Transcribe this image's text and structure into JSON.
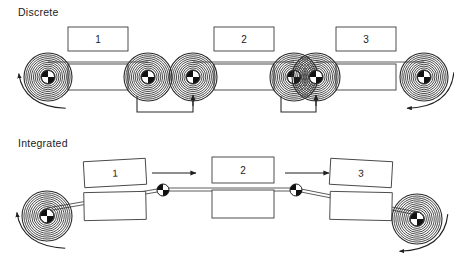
{
  "figure": {
    "kind": "process-diagram",
    "background_color": "#ffffff",
    "line_color": "#2b2b2b"
  },
  "sections": [
    {
      "id": "discrete",
      "label": "Discrete",
      "label_x": 18,
      "label_y": 16,
      "description_visual": "three separate stations, each with its own pair of material spools; brackets with up arrows indicate manual transfer of the spool between stations",
      "web_y": 62,
      "stations": [
        {
          "number": "1",
          "box_cx": 98,
          "top_box": {
            "x": 68,
            "y": 27,
            "w": 60,
            "h": 24
          },
          "bottom_box": {
            "x": 68,
            "y": 64,
            "w": 60,
            "h": 26
          }
        },
        {
          "number": "2",
          "box_cx": 244,
          "top_box": {
            "x": 214,
            "y": 27,
            "w": 60,
            "h": 24
          },
          "bottom_box": {
            "x": 214,
            "y": 64,
            "w": 60,
            "h": 26
          }
        },
        {
          "number": "3",
          "box_cx": 366,
          "top_box": {
            "x": 336,
            "y": 27,
            "w": 60,
            "h": 24
          },
          "bottom_box": {
            "x": 336,
            "y": 64,
            "w": 60,
            "h": 26
          }
        }
      ],
      "spools": [
        {
          "cx": 48,
          "cy": 77,
          "r": 24
        },
        {
          "cx": 148,
          "cy": 77,
          "r": 24
        },
        {
          "cx": 193,
          "cy": 77,
          "r": 24
        },
        {
          "cx": 294,
          "cy": 77,
          "r": 24
        },
        {
          "cx": 316,
          "cy": 77,
          "r": 24
        },
        {
          "cx": 424,
          "cy": 77,
          "r": 24
        }
      ],
      "webs": [
        {
          "x1": 48,
          "x2": 148,
          "y": 62
        },
        {
          "x1": 193,
          "x2": 294,
          "y": 62
        },
        {
          "x1": 316,
          "x2": 424,
          "y": 62
        }
      ],
      "transfer_brackets": [
        {
          "from_x": 137,
          "to_x": 193,
          "y": 112,
          "arrow_on": "right"
        },
        {
          "from_x": 281,
          "to_x": 316,
          "y": 112,
          "arrow_on": "right"
        }
      ],
      "rotation_arrows": [
        {
          "at": "left-spool",
          "cx": 48,
          "cy": 77,
          "direction": "counterclockwise"
        },
        {
          "at": "right-spool",
          "cx": 424,
          "cy": 77,
          "direction": "clockwise"
        }
      ]
    },
    {
      "id": "integrated",
      "label": "Integrated",
      "label_x": 18,
      "label_y": 147,
      "description_visual": "one continuous web runs from a single unwind spool through all three stations to a single rewind spool, supported by small idler rollers; straight arrows show the web travel direction",
      "stations": [
        {
          "number": "1",
          "box_cx": 114,
          "top_box": {
            "x": 84,
            "y": 160,
            "w": 62,
            "h": 26,
            "skew": -3.2
          },
          "bottom_box": {
            "x": 84,
            "y": 192,
            "w": 62,
            "h": 28,
            "skew": -1.2
          }
        },
        {
          "number": "2",
          "box_cx": 243,
          "top_box": {
            "x": 212,
            "y": 157,
            "w": 62,
            "h": 26,
            "skew": 0
          },
          "bottom_box": {
            "x": 212,
            "y": 190,
            "w": 62,
            "h": 28,
            "skew": 0
          }
        },
        {
          "number": "3",
          "box_cx": 361,
          "top_box": {
            "x": 330,
            "y": 160,
            "w": 62,
            "h": 26,
            "skew": 3.2
          },
          "bottom_box": {
            "x": 330,
            "y": 192,
            "w": 62,
            "h": 28,
            "skew": 1.2
          }
        }
      ],
      "spools": [
        {
          "cx": 47,
          "cy": 216,
          "r": 25,
          "role": "unwind"
        },
        {
          "cx": 417,
          "cy": 219,
          "r": 25,
          "role": "rewind"
        }
      ],
      "idler_rollers": [
        {
          "cx": 163,
          "cy": 190,
          "r": 6
        },
        {
          "cx": 296,
          "cy": 190,
          "r": 6
        }
      ],
      "web_path": [
        {
          "x": 47,
          "y": 208
        },
        {
          "x": 163,
          "y": 188
        },
        {
          "x": 296,
          "y": 188
        },
        {
          "x": 417,
          "y": 212
        }
      ],
      "direction_arrows": [
        {
          "x1": 152,
          "x2": 196,
          "y": 173,
          "direction": "right"
        },
        {
          "x1": 285,
          "x2": 329,
          "y": 173,
          "direction": "right"
        }
      ],
      "rotation_arrows": [
        {
          "at": "left-spool",
          "cx": 47,
          "cy": 216,
          "direction": "counterclockwise"
        },
        {
          "at": "right-spool",
          "cx": 417,
          "cy": 219,
          "direction": "clockwise"
        }
      ]
    }
  ]
}
